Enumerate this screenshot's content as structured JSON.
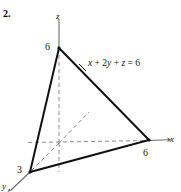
{
  "figure": {
    "problem_number": "2.",
    "equation": {
      "full": "x + 2y + z = 6",
      "var_x": "x",
      "plus_1": " + ",
      "term_2y": "2y",
      "plus_2": " + ",
      "var_z": "z",
      "equals": " = ",
      "rhs": "6"
    },
    "axes": [
      {
        "name": "z-axis",
        "label": "z",
        "style": "solid-above-origin dashed-below-origin",
        "direction": "up"
      },
      {
        "name": "x-axis",
        "label": "x",
        "style": "dashed-left-of-intercept solid-none",
        "direction": "right",
        "arrow": true
      },
      {
        "name": "y-axis",
        "label": "y",
        "style": "dashed",
        "direction": "down-left and up-right",
        "arrow": true
      }
    ],
    "intercepts": [
      {
        "axis": "z",
        "label": "6",
        "value": 6
      },
      {
        "axis": "x",
        "label": "6",
        "value": 6
      },
      {
        "axis": "y",
        "label": "3",
        "value": 3
      }
    ],
    "colors": {
      "background": "#ffffff",
      "plane_outline": "#111111",
      "axis_solid": "#555555",
      "axis_dashed": "#888888",
      "text": "#111111"
    },
    "geometry": {
      "origin": [
        59,
        143
      ],
      "vertex_z": [
        59,
        48
      ],
      "vertex_x": [
        149,
        140
      ],
      "vertex_y": [
        30,
        172
      ]
    }
  }
}
